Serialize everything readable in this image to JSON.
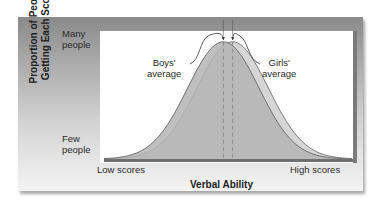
{
  "chart_data": {
    "type": "area",
    "title": "",
    "xlabel": "Verbal Ability",
    "ylabel_lines": [
      "Proportion of People",
      "Getting Each Score"
    ],
    "x_tick_labels": {
      "low": "Low scores",
      "high": "High scores"
    },
    "y_tick_labels": {
      "high": [
        "Many",
        "people"
      ],
      "low": [
        "Few",
        "people"
      ]
    },
    "xlim": [
      -4,
      4
    ],
    "ylim": [
      0,
      1
    ],
    "grid": false,
    "series": [
      {
        "name": "Boys",
        "mean": -0.15,
        "sd": 1.0,
        "peak": 0.93,
        "fill": "#b4b4b4",
        "stroke": "#6e6e6e"
      },
      {
        "name": "Girls",
        "mean": 0.15,
        "sd": 1.0,
        "peak": 0.93,
        "fill": "#cfcfcf",
        "stroke": "#7a7a7a"
      }
    ],
    "annotations": [
      {
        "label": [
          "Boys'",
          "average"
        ],
        "points_to": "Boys",
        "side": "left"
      },
      {
        "label": [
          "Girls'",
          "average"
        ],
        "points_to": "Girls",
        "side": "right"
      }
    ]
  }
}
